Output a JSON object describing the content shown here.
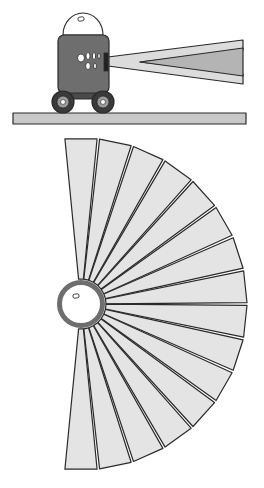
{
  "figure": {
    "width": 264,
    "height": 488,
    "background": "#ffffff"
  },
  "colors": {
    "outline": "#2a2a2a",
    "robot_body": "#6e6e6e",
    "robot_body_dark": "#4a4a4a",
    "dome": "#ffffff",
    "wheel_tire": "#3a3a3a",
    "wheel_hub": "#9a9a9a",
    "ground": "#c8c8c8",
    "beam_outer": "#dcdcdc",
    "beam_inner": "#b4b4b4",
    "fan_wedge": "#e4e4e4",
    "sensor_ring": "#6e6e6e",
    "sensor_hole": "#ffffff"
  },
  "robot_scene": {
    "ground": {
      "x": 13,
      "y": 113,
      "w": 233,
      "h": 11
    },
    "body": {
      "x": 58,
      "y": 35,
      "w": 51,
      "h": 58,
      "r": 6
    },
    "dome": {
      "cx": 83,
      "cy": 35,
      "rx": 20,
      "ry": 22
    },
    "dome_mark": {
      "x": 78,
      "y": 17,
      "w": 6,
      "h": 4
    },
    "chassis": {
      "x": 62,
      "y": 89,
      "w": 44,
      "h": 10
    },
    "wheels": [
      {
        "cx": 63,
        "cy": 102,
        "r": 11
      },
      {
        "cx": 103,
        "cy": 102,
        "r": 11
      }
    ],
    "sensor_holes": [
      {
        "cx": 81,
        "cy": 58,
        "rx": 3.5,
        "ry": 4
      },
      {
        "cx": 88,
        "cy": 56,
        "rx": 2,
        "ry": 3.5
      },
      {
        "cx": 94,
        "cy": 56,
        "rx": 1.6,
        "ry": 3.5
      },
      {
        "cx": 88,
        "cy": 66,
        "rx": 2.4,
        "ry": 3.5
      },
      {
        "cx": 95,
        "cy": 66,
        "rx": 1.4,
        "ry": 3
      },
      {
        "cx": 99,
        "cy": 56,
        "rx": 1.2,
        "ry": 3
      }
    ],
    "emitter": {
      "x": 104,
      "y": 53,
      "w": 4,
      "h": 18
    },
    "beam_outer": {
      "points": [
        [
          108,
          57
        ],
        [
          243,
          40
        ],
        [
          243,
          50
        ],
        [
          140,
          62
        ],
        [
          243,
          74
        ],
        [
          243,
          84
        ],
        [
          108,
          66
        ]
      ]
    },
    "beam_inner": {
      "points": [
        [
          140,
          62
        ],
        [
          243,
          48
        ],
        [
          243,
          76
        ]
      ]
    }
  },
  "fan_diagram": {
    "center": {
      "x": 81,
      "y": 304
    },
    "ring_outer_radius": 24,
    "ring_inner_radius": 19,
    "ring_mark": {
      "x": 73,
      "y": 294,
      "w": 6,
      "h": 4
    },
    "wedge_inner_radius": 25,
    "wedge_outer_radius": 166,
    "start_angle_deg": -96,
    "end_angle_deg": 96,
    "wedge_count": 16,
    "gap_deg": 0.9
  }
}
